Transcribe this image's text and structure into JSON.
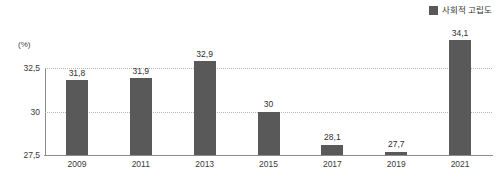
{
  "chart_data": {
    "type": "bar",
    "title": "",
    "xlabel": "",
    "ylabel": "(%)",
    "unit_label": "(%)",
    "categories": [
      "2009",
      "2011",
      "2013",
      "2015",
      "2017",
      "2019",
      "2021"
    ],
    "values": [
      31.8,
      31.9,
      32.9,
      30,
      28.1,
      27.7,
      34.1
    ],
    "value_labels": [
      "31,8",
      "31,9",
      "32,9",
      "30",
      "28,1",
      "27,7",
      "34,1"
    ],
    "ylim": [
      27.5,
      32.5
    ],
    "y_ticks": [
      27.5,
      30,
      32.5
    ],
    "y_tick_labels": [
      "27,5",
      "30",
      "32,5"
    ],
    "grid": true,
    "grid_style": "dotted",
    "legend_position": "top-right",
    "series": [
      {
        "name": "사회적 고립도",
        "color": "#595959",
        "values": [
          31.8,
          31.9,
          32.9,
          30,
          28.1,
          27.7,
          34.1
        ]
      }
    ]
  },
  "legend": {
    "label": "사회적 고립도",
    "swatch_color": "#595959"
  },
  "axis": {
    "unit": "(%)",
    "y_top": "32,5",
    "y_mid": "30",
    "y_bottom": "27,5"
  },
  "bars": [
    {
      "category": "2009",
      "label": "31,8",
      "value": 31.8
    },
    {
      "category": "2011",
      "label": "31,9",
      "value": 31.9
    },
    {
      "category": "2013",
      "label": "32,9",
      "value": 32.9
    },
    {
      "category": "2015",
      "label": "30",
      "value": 30
    },
    {
      "category": "2017",
      "label": "28,1",
      "value": 28.1
    },
    {
      "category": "2019",
      "label": "27,7",
      "value": 27.7
    },
    {
      "category": "2021",
      "label": "34,1",
      "value": 34.1
    }
  ],
  "colors": {
    "bar": "#595959",
    "axis": "#8c8c8c",
    "grid": "#b4b4b4",
    "text": "#3a3a3a",
    "background": "#ffffff"
  }
}
